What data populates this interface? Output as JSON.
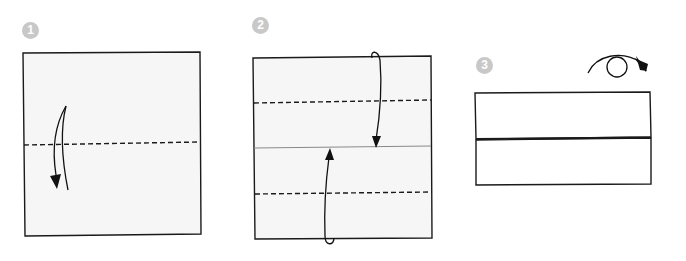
{
  "diagram": {
    "type": "origami-instructions",
    "colors": {
      "paper_fill": "#f6f6f6",
      "paper_fill_step3": "#ffffff",
      "outline": "#1a1a1a",
      "badge": "#c8c8c8",
      "badge_text": "#ffffff",
      "crease_line": "#888888"
    },
    "steps": [
      {
        "number": "1",
        "description": "Valley fold square in half along horizontal dashed line, folding top down",
        "fold_lines": [
          "horizontal center dashed (valley)"
        ],
        "arrows": [
          "curved arrow pointing down"
        ]
      },
      {
        "number": "2",
        "description": "Fold top and bottom edges to the center crease along dashed lines",
        "fold_lines": [
          "upper quarter dashed (valley)",
          "center crease (solid)",
          "lower quarter dashed (valley)"
        ],
        "arrows": [
          "top edge folds down to center",
          "bottom edge folds up to center"
        ]
      },
      {
        "number": "3",
        "description": "Turn the model over",
        "fold_lines": [],
        "arrows": [
          "turn-over arrow (loop)"
        ]
      }
    ]
  }
}
